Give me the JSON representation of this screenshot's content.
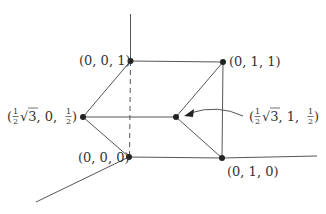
{
  "diagram": {
    "type": "3d-simplex-graph",
    "colors": {
      "line": "#555555",
      "node": "#222222",
      "text": "#333333",
      "background": "#ffffff"
    },
    "nodes": [
      {
        "id": "n001",
        "label": "(0, 0, 1)",
        "x": 130.5,
        "y": 61
      },
      {
        "id": "n011",
        "label": "(0, 1, 1)",
        "x": 223,
        "y": 62
      },
      {
        "id": "nh0h",
        "label": "(½√3, 0, ½)",
        "x": 83,
        "y": 117
      },
      {
        "id": "nh1h",
        "label": "(½√3, 1, ½)",
        "x": 176,
        "y": 117
      },
      {
        "id": "n000",
        "label": "(0, 0, 0)",
        "x": 129,
        "y": 157
      },
      {
        "id": "n010",
        "label": "(0, 1, 0)",
        "x": 222,
        "y": 158
      }
    ],
    "edges": [
      [
        "n001",
        "n011"
      ],
      [
        "n001",
        "nh0h"
      ],
      [
        "nh0h",
        "n000"
      ],
      [
        "n000",
        "n010"
      ],
      [
        "n011",
        "nh1h"
      ],
      [
        "nh1h",
        "n010"
      ],
      [
        "n011",
        "n010"
      ],
      [
        "nh0h",
        "nh1h"
      ]
    ],
    "dashed_edges": [
      [
        "n001",
        "n000"
      ]
    ],
    "axes": [
      {
        "name": "z-axis",
        "from": [
          130.5,
          14
        ],
        "to": [
          130.5,
          61
        ]
      },
      {
        "name": "y-axis",
        "from": [
          222,
          158
        ],
        "to": [
          317,
          156
        ]
      },
      {
        "name": "x-axis",
        "from": [
          129,
          157
        ],
        "to": [
          36,
          202
        ]
      }
    ],
    "labels": {
      "n001": "(0, 0, 1)",
      "n011": "(0, 1, 1)",
      "nh0h_pre": "(",
      "nh0h_sqrt": "√3, 0, ",
      "nh0h_post": ")",
      "nh1h_pre": "(",
      "nh1h_sqrt": "√3, 1, ",
      "nh1h_post": ")",
      "n000": "(0, 0, 0)",
      "n010": "(0, 1, 0)",
      "half_num": "1",
      "half_den": "2"
    },
    "annotation": {
      "text": "(½√3, 1, ½)",
      "arrow_points_to": "nh1h"
    }
  }
}
